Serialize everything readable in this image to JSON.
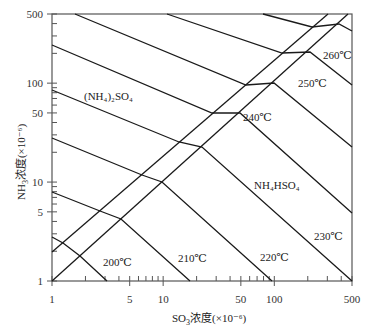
{
  "chart_data": {
    "type": "line",
    "title": "",
    "xlabel": "SO3浓度(×10⁻⁶)",
    "ylabel": "NH3浓度(×10⁻⁶)",
    "xscale": "log",
    "yscale": "log",
    "xlim": [
      1,
      500
    ],
    "ylim": [
      1,
      500
    ],
    "grid": false,
    "legend": "none",
    "x_ticks": [
      {
        "value": 1,
        "label": "1"
      },
      {
        "value": 5,
        "label": "5"
      },
      {
        "value": 10,
        "label": "10"
      },
      {
        "value": 50,
        "label": "50"
      },
      {
        "value": 100,
        "label": "100"
      },
      {
        "value": 500,
        "label": "500"
      }
    ],
    "y_ticks": [
      {
        "value": 1,
        "label": "1"
      },
      {
        "value": 5,
        "label": "5"
      },
      {
        "value": 10,
        "label": "10"
      },
      {
        "value": 50,
        "label": "50"
      },
      {
        "value": 100,
        "label": "100"
      },
      {
        "value": 500,
        "label": "500"
      }
    ],
    "region_labels": [
      {
        "text": "(NH4)2SO4",
        "x": 84,
        "y": 97
      },
      {
        "text": "NH4HSO4",
        "x": 254,
        "y": 186
      }
    ],
    "boundary_lines": [
      {
        "name": "upper-diagonal",
        "points": [
          [
            52,
            252
          ],
          [
            328,
            14
          ]
        ]
      },
      {
        "name": "lower-diagonal",
        "points": [
          [
            52,
            281
          ],
          [
            348,
            14
          ]
        ]
      }
    ],
    "series": [
      {
        "name": "unlabeled",
        "label": "",
        "points": [
          [
            52,
            237
          ],
          [
            63,
            243
          ],
          [
            80,
            256
          ],
          [
            107,
            281
          ]
        ]
      },
      {
        "name": "200℃",
        "label": "200℃",
        "label_pos": [
          103,
          262
        ],
        "points": [
          [
            52,
            192
          ],
          [
            100,
            211
          ],
          [
            121,
            219
          ],
          [
            190,
            281
          ]
        ]
      },
      {
        "name": "210℃",
        "label": "210℃",
        "label_pos": [
          178,
          258
        ],
        "points": [
          [
            52,
            138
          ],
          [
            142,
            175
          ],
          [
            162,
            182
          ],
          [
            272,
            281
          ]
        ]
      },
      {
        "name": "220℃",
        "label": "220℃",
        "label_pos": [
          260,
          257
        ],
        "points": [
          [
            52,
            90
          ],
          [
            179,
            142
          ],
          [
            202,
            147
          ],
          [
            352,
            281
          ]
        ]
      },
      {
        "name": "230℃",
        "label": "230℃",
        "label_pos": [
          314,
          236
        ],
        "points": [
          [
            52,
            45
          ],
          [
            212,
            113
          ],
          [
            240,
            113
          ],
          [
            352,
            213
          ]
        ]
      },
      {
        "name": "240℃",
        "label": "240℃",
        "label_pos": [
          243,
          117
        ],
        "points": [
          [
            75,
            14
          ],
          [
            246,
            85
          ],
          [
            274,
            83
          ],
          [
            352,
            147
          ]
        ]
      },
      {
        "name": "250℃",
        "label": "250℃",
        "label_pos": [
          298,
          83
        ],
        "points": [
          [
            167,
            14
          ],
          [
            282,
            53
          ],
          [
            310,
            52
          ],
          [
            352,
            85
          ]
        ]
      },
      {
        "name": "260℃",
        "label": "260℃",
        "label_pos": [
          323,
          55
        ],
        "points": [
          [
            263,
            14
          ],
          [
            312,
            27
          ],
          [
            339,
            24
          ],
          [
            352,
            31
          ]
        ]
      }
    ]
  },
  "plot_frame": {
    "left": 52,
    "top": 14,
    "right": 352,
    "bottom": 281
  },
  "labels": {
    "xlabel_prefix": "SO",
    "xlabel_sub": "3",
    "xlabel_suffix": "浓度(×10⁻⁶)",
    "ylabel_prefix": "NH",
    "ylabel_sub": "3",
    "ylabel_suffix": "浓度(×10⁻⁶)",
    "ammonium_sulfate": "(NH₄)₂SO₄",
    "ammonium_bisulfate": "NH₄HSO₄",
    "t200": "200℃",
    "t210": "210℃",
    "t220": "220℃",
    "t230": "230℃",
    "t240": "240℃",
    "t250": "250℃",
    "t260": "260℃"
  },
  "colors": {
    "line": "#1a1a1a",
    "frame": "#555555",
    "text": "#222222"
  }
}
